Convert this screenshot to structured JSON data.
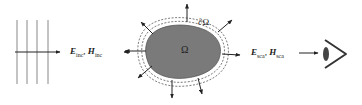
{
  "incident": {
    "e_symbol": "E",
    "e_sub": "inc",
    "sep": ",",
    "h_symbol": "H",
    "h_sub": "inc"
  },
  "scattered": {
    "e_symbol": "E",
    "e_sub": "sca",
    "sep": ",",
    "h_symbol": "H",
    "h_sub": "sca"
  },
  "domain_label": "Ω",
  "boundary_label": "∂Ω",
  "colors": {
    "scatterer_fill": "#7a7a7a",
    "lines": "#333333",
    "wavefronts": "#888888"
  }
}
